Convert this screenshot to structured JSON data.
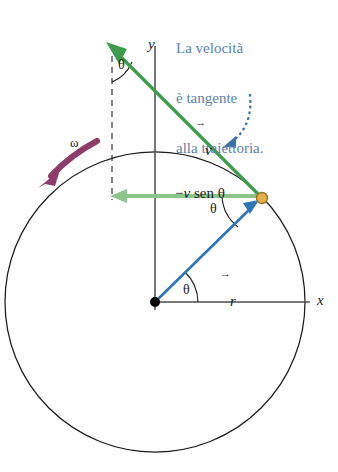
{
  "figure": {
    "title_annotation": {
      "line1": "La velocità",
      "line2": "è tangente",
      "line3": "alla traiettoria.",
      "color": "#5b82a8"
    },
    "axes": {
      "x_label": "x",
      "y_label": "y",
      "axis_color": "#4d4d4d"
    },
    "vectors": {
      "velocity": {
        "label": "v",
        "overbar": "→",
        "color": "#3f9c4f"
      },
      "radius": {
        "label": "r",
        "overbar": "→",
        "color": "#2f74b5"
      },
      "velocity_x_component": {
        "label_minus": "−",
        "label_v": "v",
        "label_sin": " sen ",
        "label_theta": "θ",
        "full_label": "−v sen θ",
        "color": "#8cc48c"
      }
    },
    "angles": {
      "theta_top": "θ",
      "theta_particle": "θ",
      "theta_origin": "θ",
      "arc_color": "#1a1a1a"
    },
    "angular_velocity": {
      "label": "ω",
      "arrow_color": "#8e3d6b",
      "direction": "counterclockwise"
    },
    "particle": {
      "fill_color": "#e0b050",
      "stroke_color": "#9a7320"
    },
    "circle": {
      "stroke_color": "#1a1a1a",
      "center_x": 155,
      "center_y": 302,
      "radius": 150
    },
    "origin_dot": {
      "color": "#000000"
    },
    "callout_pointer": {
      "style": "dotted-curve",
      "color": "#3d6fa5"
    },
    "dashed_guide": {
      "color": "#333333",
      "style": "dashed"
    }
  }
}
